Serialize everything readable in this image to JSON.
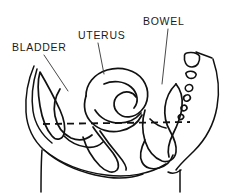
{
  "diagram": {
    "background_color": "#ffffff",
    "line_color": "#111111",
    "label_color": "#1a1a1a",
    "width": 237,
    "height": 194,
    "labels": [
      {
        "id": "bladder",
        "text": "BLADDER",
        "text_x": 12,
        "text_y": 51,
        "leader_from_x": 44,
        "leader_from_y": 55,
        "leader_to_x": 68,
        "leader_to_y": 91
      },
      {
        "id": "uterus",
        "text": "UTERUS",
        "text_x": 78,
        "text_y": 39,
        "leader_from_x": 98,
        "leader_from_y": 43,
        "leader_to_x": 104,
        "leader_to_y": 74
      },
      {
        "id": "bowel",
        "text": "BOWEL",
        "text_x": 143,
        "text_y": 25,
        "leader_from_x": 168,
        "leader_from_y": 29,
        "leader_to_x": 162,
        "leader_to_y": 84
      }
    ],
    "reference_line": {
      "id": "pelvic-floor-reference",
      "x1": 43,
      "y1": 124,
      "x2": 190,
      "y2": 122,
      "dash_pattern": "7 5"
    },
    "vertebrae": [
      {
        "id": "sacrum-segment-1",
        "cx": 192,
        "cy": 60,
        "rx": 7.5,
        "ry": 7.0
      },
      {
        "id": "sacrum-segment-2",
        "cx": 191,
        "cy": 76,
        "rx": 5.2,
        "ry": 4.4
      },
      {
        "id": "coccyx-segment-1",
        "cx": 189,
        "cy": 88,
        "rx": 3.8,
        "ry": 3.4
      },
      {
        "id": "coccyx-segment-2",
        "cx": 187,
        "cy": 98,
        "rx": 3.4,
        "ry": 3.0
      },
      {
        "id": "coccyx-segment-3",
        "cx": 184,
        "cy": 108,
        "rx": 3.0,
        "ry": 2.7
      },
      {
        "id": "coccyx-segment-4",
        "cx": 181,
        "cy": 117,
        "rx": 2.7,
        "ry": 2.4
      }
    ],
    "organs": [
      {
        "id": "bladder-outline",
        "name": "bladder"
      },
      {
        "id": "uterus-outline",
        "name": "uterus"
      },
      {
        "id": "vagina-outline",
        "name": "vagina"
      },
      {
        "id": "rectum-outline",
        "name": "rectum-bowel"
      }
    ],
    "contours": [
      {
        "id": "abdominal-wall-left",
        "name": "anterior abdominal wall"
      },
      {
        "id": "perineal-contour",
        "name": "perineal contour"
      },
      {
        "id": "back-contour-right",
        "name": "posterior back contour"
      },
      {
        "id": "thigh-line-left",
        "name": "left thigh line"
      },
      {
        "id": "buttock-contour",
        "name": "buttock contour"
      }
    ]
  }
}
